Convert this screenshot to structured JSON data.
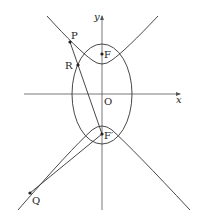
{
  "diagram": {
    "type": "conic-sections",
    "axes": {
      "x_label": "x",
      "y_label": "y",
      "origin_label": "O"
    },
    "points": {
      "P": "P",
      "R": "R",
      "Q": "Q",
      "F": "F",
      "F_prime": "F′"
    },
    "colors": {
      "stroke": "#333333",
      "axis": "#555555",
      "background": "#ffffff"
    }
  }
}
